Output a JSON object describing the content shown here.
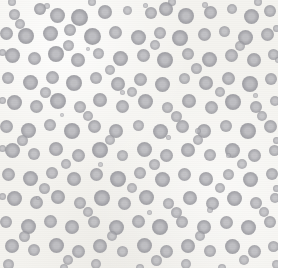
{
  "image": {
    "kind": "micrograph",
    "subject": "blood-smear-erythrocytes",
    "width": 284,
    "height": 274,
    "background_color": "#f4f3ef",
    "border_color": "#ffffff",
    "cell_fill_color": "#9a9aa0",
    "cell_center_color": "#b9b9be",
    "cell_count": 206
  },
  "chart_data": {
    "type": "scatter",
    "title": "",
    "xlabel": "",
    "ylabel": "",
    "xlim": [
      0,
      284
    ],
    "ylim": [
      0,
      274
    ],
    "grid": false,
    "legend": null,
    "points": [
      {
        "x": 14,
        "y": 14,
        "r": 5.5,
        "t": 0.55
      },
      {
        "x": 40,
        "y": 9,
        "r": 6.0,
        "t": 0.7
      },
      {
        "x": 57,
        "y": 15,
        "r": 7.5,
        "t": 0.72
      },
      {
        "x": 79,
        "y": 17,
        "r": 8.5,
        "t": 0.8
      },
      {
        "x": 105,
        "y": 12,
        "r": 7.0,
        "t": 0.7
      },
      {
        "x": 127,
        "y": 10,
        "r": 4.5,
        "t": 0.45
      },
      {
        "x": 151,
        "y": 13,
        "r": 6.0,
        "t": 0.6
      },
      {
        "x": 166,
        "y": 9,
        "r": 7.0,
        "t": 0.74
      },
      {
        "x": 186,
        "y": 16,
        "r": 8.0,
        "t": 0.76
      },
      {
        "x": 210,
        "y": 12,
        "r": 6.5,
        "t": 0.66
      },
      {
        "x": 232,
        "y": 9,
        "r": 5.0,
        "t": 0.52
      },
      {
        "x": 251,
        "y": 16,
        "r": 7.5,
        "t": 0.74
      },
      {
        "x": 270,
        "y": 11,
        "r": 6.0,
        "t": 0.62
      },
      {
        "x": 6,
        "y": 33,
        "r": 6.5,
        "t": 0.66
      },
      {
        "x": 26,
        "y": 36,
        "r": 8.0,
        "t": 0.78
      },
      {
        "x": 50,
        "y": 33,
        "r": 7.5,
        "t": 0.74
      },
      {
        "x": 70,
        "y": 30,
        "r": 6.0,
        "t": 0.62
      },
      {
        "x": 92,
        "y": 36,
        "r": 8.5,
        "t": 0.8
      },
      {
        "x": 115,
        "y": 32,
        "r": 6.5,
        "t": 0.64
      },
      {
        "x": 138,
        "y": 37,
        "r": 7.5,
        "t": 0.72
      },
      {
        "x": 160,
        "y": 33,
        "r": 6.0,
        "t": 0.58
      },
      {
        "x": 180,
        "y": 38,
        "r": 8.0,
        "t": 0.76
      },
      {
        "x": 204,
        "y": 34,
        "r": 6.5,
        "t": 0.66
      },
      {
        "x": 224,
        "y": 31,
        "r": 5.5,
        "t": 0.54
      },
      {
        "x": 245,
        "y": 37,
        "r": 7.5,
        "t": 0.74
      },
      {
        "x": 267,
        "y": 34,
        "r": 6.5,
        "t": 0.64
      },
      {
        "x": 12,
        "y": 55,
        "r": 7.5,
        "t": 0.74
      },
      {
        "x": 34,
        "y": 58,
        "r": 6.5,
        "t": 0.64
      },
      {
        "x": 56,
        "y": 54,
        "r": 8.0,
        "t": 0.78
      },
      {
        "x": 78,
        "y": 60,
        "r": 7.0,
        "t": 0.68
      },
      {
        "x": 98,
        "y": 53,
        "r": 5.5,
        "t": 0.52
      },
      {
        "x": 120,
        "y": 58,
        "r": 7.5,
        "t": 0.72
      },
      {
        "x": 143,
        "y": 55,
        "r": 6.5,
        "t": 0.64
      },
      {
        "x": 165,
        "y": 60,
        "r": 8.0,
        "t": 0.78
      },
      {
        "x": 188,
        "y": 54,
        "r": 6.0,
        "t": 0.58
      },
      {
        "x": 209,
        "y": 59,
        "r": 7.5,
        "t": 0.74
      },
      {
        "x": 231,
        "y": 55,
        "r": 6.5,
        "t": 0.62
      },
      {
        "x": 254,
        "y": 60,
        "r": 7.0,
        "t": 0.7
      },
      {
        "x": 273,
        "y": 54,
        "r": 5.5,
        "t": 0.54
      },
      {
        "x": 8,
        "y": 78,
        "r": 6.0,
        "t": 0.6
      },
      {
        "x": 30,
        "y": 82,
        "r": 7.5,
        "t": 0.74
      },
      {
        "x": 52,
        "y": 77,
        "r": 6.5,
        "t": 0.64
      },
      {
        "x": 74,
        "y": 83,
        "r": 8.0,
        "t": 0.78
      },
      {
        "x": 96,
        "y": 78,
        "r": 6.0,
        "t": 0.58
      },
      {
        "x": 118,
        "y": 84,
        "r": 7.0,
        "t": 0.7
      },
      {
        "x": 140,
        "y": 79,
        "r": 6.5,
        "t": 0.64
      },
      {
        "x": 162,
        "y": 84,
        "r": 7.5,
        "t": 0.74
      },
      {
        "x": 184,
        "y": 78,
        "r": 5.5,
        "t": 0.52
      },
      {
        "x": 206,
        "y": 83,
        "r": 7.0,
        "t": 0.7
      },
      {
        "x": 228,
        "y": 78,
        "r": 6.5,
        "t": 0.64
      },
      {
        "x": 250,
        "y": 84,
        "r": 8.0,
        "t": 0.78
      },
      {
        "x": 271,
        "y": 79,
        "r": 6.0,
        "t": 0.6
      },
      {
        "x": 14,
        "y": 102,
        "r": 7.5,
        "t": 0.74
      },
      {
        "x": 36,
        "y": 106,
        "r": 6.5,
        "t": 0.64
      },
      {
        "x": 58,
        "y": 101,
        "r": 8.0,
        "t": 0.78
      },
      {
        "x": 80,
        "y": 107,
        "r": 6.0,
        "t": 0.58
      },
      {
        "x": 100,
        "y": 100,
        "r": 7.0,
        "t": 0.7
      },
      {
        "x": 122,
        "y": 106,
        "r": 6.5,
        "t": 0.64
      },
      {
        "x": 145,
        "y": 101,
        "r": 7.5,
        "t": 0.74
      },
      {
        "x": 167,
        "y": 107,
        "r": 5.5,
        "t": 0.52
      },
      {
        "x": 189,
        "y": 101,
        "r": 7.0,
        "t": 0.7
      },
      {
        "x": 211,
        "y": 107,
        "r": 6.5,
        "t": 0.64
      },
      {
        "x": 233,
        "y": 102,
        "r": 8.0,
        "t": 0.78
      },
      {
        "x": 256,
        "y": 107,
        "r": 6.0,
        "t": 0.6
      },
      {
        "x": 275,
        "y": 101,
        "r": 5.0,
        "t": 0.48
      },
      {
        "x": 6,
        "y": 126,
        "r": 6.5,
        "t": 0.64
      },
      {
        "x": 28,
        "y": 130,
        "r": 7.5,
        "t": 0.74
      },
      {
        "x": 50,
        "y": 125,
        "r": 6.0,
        "t": 0.58
      },
      {
        "x": 72,
        "y": 131,
        "r": 8.0,
        "t": 0.78
      },
      {
        "x": 94,
        "y": 126,
        "r": 6.5,
        "t": 0.64
      },
      {
        "x": 116,
        "y": 131,
        "r": 7.0,
        "t": 0.7
      },
      {
        "x": 138,
        "y": 125,
        "r": 5.5,
        "t": 0.52
      },
      {
        "x": 160,
        "y": 131,
        "r": 7.5,
        "t": 0.74
      },
      {
        "x": 182,
        "y": 126,
        "r": 6.5,
        "t": 0.64
      },
      {
        "x": 204,
        "y": 131,
        "r": 7.0,
        "t": 0.7
      },
      {
        "x": 226,
        "y": 126,
        "r": 6.0,
        "t": 0.58
      },
      {
        "x": 248,
        "y": 131,
        "r": 8.0,
        "t": 0.78
      },
      {
        "x": 270,
        "y": 126,
        "r": 6.5,
        "t": 0.64
      },
      {
        "x": 12,
        "y": 150,
        "r": 7.5,
        "t": 0.74
      },
      {
        "x": 34,
        "y": 154,
        "r": 6.0,
        "t": 0.58
      },
      {
        "x": 56,
        "y": 149,
        "r": 7.0,
        "t": 0.7
      },
      {
        "x": 78,
        "y": 155,
        "r": 6.5,
        "t": 0.64
      },
      {
        "x": 100,
        "y": 150,
        "r": 8.0,
        "t": 0.78
      },
      {
        "x": 122,
        "y": 155,
        "r": 5.5,
        "t": 0.52
      },
      {
        "x": 144,
        "y": 149,
        "r": 7.5,
        "t": 0.74
      },
      {
        "x": 166,
        "y": 155,
        "r": 6.5,
        "t": 0.64
      },
      {
        "x": 188,
        "y": 150,
        "r": 7.0,
        "t": 0.7
      },
      {
        "x": 210,
        "y": 155,
        "r": 6.0,
        "t": 0.58
      },
      {
        "x": 232,
        "y": 150,
        "r": 7.5,
        "t": 0.74
      },
      {
        "x": 254,
        "y": 155,
        "r": 6.5,
        "t": 0.64
      },
      {
        "x": 274,
        "y": 150,
        "r": 5.5,
        "t": 0.54
      },
      {
        "x": 8,
        "y": 174,
        "r": 6.5,
        "t": 0.64
      },
      {
        "x": 30,
        "y": 178,
        "r": 7.5,
        "t": 0.74
      },
      {
        "x": 52,
        "y": 173,
        "r": 6.0,
        "t": 0.58
      },
      {
        "x": 74,
        "y": 179,
        "r": 7.0,
        "t": 0.7
      },
      {
        "x": 96,
        "y": 174,
        "r": 6.5,
        "t": 0.64
      },
      {
        "x": 118,
        "y": 179,
        "r": 8.0,
        "t": 0.78
      },
      {
        "x": 140,
        "y": 173,
        "r": 6.0,
        "t": 0.58
      },
      {
        "x": 162,
        "y": 179,
        "r": 7.5,
        "t": 0.74
      },
      {
        "x": 184,
        "y": 174,
        "r": 6.5,
        "t": 0.64
      },
      {
        "x": 206,
        "y": 179,
        "r": 7.0,
        "t": 0.7
      },
      {
        "x": 228,
        "y": 174,
        "r": 5.5,
        "t": 0.52
      },
      {
        "x": 250,
        "y": 179,
        "r": 7.5,
        "t": 0.74
      },
      {
        "x": 272,
        "y": 174,
        "r": 6.0,
        "t": 0.6
      },
      {
        "x": 14,
        "y": 198,
        "r": 7.5,
        "t": 0.74
      },
      {
        "x": 36,
        "y": 202,
        "r": 6.5,
        "t": 0.64
      },
      {
        "x": 58,
        "y": 197,
        "r": 7.0,
        "t": 0.7
      },
      {
        "x": 80,
        "y": 203,
        "r": 6.0,
        "t": 0.58
      },
      {
        "x": 102,
        "y": 198,
        "r": 8.0,
        "t": 0.78
      },
      {
        "x": 124,
        "y": 203,
        "r": 6.5,
        "t": 0.64
      },
      {
        "x": 146,
        "y": 197,
        "r": 7.5,
        "t": 0.74
      },
      {
        "x": 168,
        "y": 203,
        "r": 5.5,
        "t": 0.52
      },
      {
        "x": 190,
        "y": 198,
        "r": 7.0,
        "t": 0.7
      },
      {
        "x": 212,
        "y": 203,
        "r": 6.5,
        "t": 0.64
      },
      {
        "x": 234,
        "y": 198,
        "r": 7.5,
        "t": 0.74
      },
      {
        "x": 256,
        "y": 203,
        "r": 6.0,
        "t": 0.58
      },
      {
        "x": 275,
        "y": 198,
        "r": 5.0,
        "t": 0.48
      },
      {
        "x": 6,
        "y": 222,
        "r": 6.0,
        "t": 0.6
      },
      {
        "x": 28,
        "y": 226,
        "r": 7.5,
        "t": 0.74
      },
      {
        "x": 50,
        "y": 221,
        "r": 6.5,
        "t": 0.64
      },
      {
        "x": 72,
        "y": 227,
        "r": 7.0,
        "t": 0.7
      },
      {
        "x": 94,
        "y": 222,
        "r": 6.0,
        "t": 0.58
      },
      {
        "x": 116,
        "y": 227,
        "r": 7.5,
        "t": 0.74
      },
      {
        "x": 138,
        "y": 221,
        "r": 6.5,
        "t": 0.64
      },
      {
        "x": 160,
        "y": 227,
        "r": 8.0,
        "t": 0.78
      },
      {
        "x": 182,
        "y": 222,
        "r": 6.0,
        "t": 0.58
      },
      {
        "x": 204,
        "y": 227,
        "r": 7.0,
        "t": 0.7
      },
      {
        "x": 226,
        "y": 222,
        "r": 6.5,
        "t": 0.64
      },
      {
        "x": 248,
        "y": 227,
        "r": 7.5,
        "t": 0.74
      },
      {
        "x": 270,
        "y": 222,
        "r": 6.0,
        "t": 0.6
      },
      {
        "x": 12,
        "y": 246,
        "r": 7.0,
        "t": 0.7
      },
      {
        "x": 34,
        "y": 250,
        "r": 6.0,
        "t": 0.58
      },
      {
        "x": 56,
        "y": 245,
        "r": 7.5,
        "t": 0.74
      },
      {
        "x": 78,
        "y": 251,
        "r": 6.5,
        "t": 0.64
      },
      {
        "x": 100,
        "y": 246,
        "r": 7.0,
        "t": 0.7
      },
      {
        "x": 122,
        "y": 251,
        "r": 5.5,
        "t": 0.52
      },
      {
        "x": 144,
        "y": 245,
        "r": 7.5,
        "t": 0.74
      },
      {
        "x": 166,
        "y": 251,
        "r": 6.5,
        "t": 0.64
      },
      {
        "x": 188,
        "y": 246,
        "r": 7.0,
        "t": 0.7
      },
      {
        "x": 210,
        "y": 251,
        "r": 6.0,
        "t": 0.58
      },
      {
        "x": 232,
        "y": 246,
        "r": 7.5,
        "t": 0.74
      },
      {
        "x": 254,
        "y": 251,
        "r": 6.5,
        "t": 0.64
      },
      {
        "x": 273,
        "y": 246,
        "r": 5.5,
        "t": 0.54
      },
      {
        "x": 20,
        "y": 24,
        "r": 5.0,
        "t": 0.48
      },
      {
        "x": 68,
        "y": 45,
        "r": 5.5,
        "t": 0.52
      },
      {
        "x": 110,
        "y": 70,
        "r": 5.0,
        "t": 0.46
      },
      {
        "x": 155,
        "y": 45,
        "r": 5.0,
        "t": 0.48
      },
      {
        "x": 196,
        "y": 68,
        "r": 5.5,
        "t": 0.52
      },
      {
        "x": 240,
        "y": 46,
        "r": 5.0,
        "t": 0.46
      },
      {
        "x": 45,
        "y": 92,
        "r": 5.5,
        "t": 0.52
      },
      {
        "x": 88,
        "y": 116,
        "r": 5.0,
        "t": 0.48
      },
      {
        "x": 132,
        "y": 92,
        "r": 5.0,
        "t": 0.46
      },
      {
        "x": 176,
        "y": 116,
        "r": 5.5,
        "t": 0.52
      },
      {
        "x": 220,
        "y": 92,
        "r": 5.0,
        "t": 0.48
      },
      {
        "x": 262,
        "y": 116,
        "r": 5.0,
        "t": 0.46
      },
      {
        "x": 22,
        "y": 140,
        "r": 5.5,
        "t": 0.52
      },
      {
        "x": 66,
        "y": 164,
        "r": 5.0,
        "t": 0.48
      },
      {
        "x": 110,
        "y": 140,
        "r": 5.0,
        "t": 0.46
      },
      {
        "x": 154,
        "y": 164,
        "r": 5.5,
        "t": 0.52
      },
      {
        "x": 198,
        "y": 140,
        "r": 5.0,
        "t": 0.48
      },
      {
        "x": 242,
        "y": 164,
        "r": 5.0,
        "t": 0.46
      },
      {
        "x": 44,
        "y": 188,
        "r": 5.5,
        "t": 0.52
      },
      {
        "x": 88,
        "y": 212,
        "r": 5.0,
        "t": 0.48
      },
      {
        "x": 132,
        "y": 188,
        "r": 5.0,
        "t": 0.46
      },
      {
        "x": 176,
        "y": 212,
        "r": 5.5,
        "t": 0.52
      },
      {
        "x": 220,
        "y": 188,
        "r": 5.0,
        "t": 0.48
      },
      {
        "x": 264,
        "y": 212,
        "r": 5.0,
        "t": 0.46
      },
      {
        "x": 24,
        "y": 236,
        "r": 5.5,
        "t": 0.52
      },
      {
        "x": 68,
        "y": 260,
        "r": 5.0,
        "t": 0.48
      },
      {
        "x": 112,
        "y": 236,
        "r": 5.0,
        "t": 0.46
      },
      {
        "x": 156,
        "y": 260,
        "r": 5.5,
        "t": 0.52
      },
      {
        "x": 200,
        "y": 236,
        "r": 5.0,
        "t": 0.48
      },
      {
        "x": 244,
        "y": 260,
        "r": 5.0,
        "t": 0.46
      },
      {
        "x": 8,
        "y": 264,
        "r": 5.5,
        "t": 0.5
      },
      {
        "x": 96,
        "y": 264,
        "r": 5.0,
        "t": 0.46
      },
      {
        "x": 186,
        "y": 264,
        "r": 5.0,
        "t": 0.44
      },
      {
        "x": 276,
        "y": 264,
        "r": 4.5,
        "t": 0.42
      },
      {
        "x": 47,
        "y": 6,
        "r": 3.0,
        "t": 0.34
      },
      {
        "x": 145,
        "y": 5,
        "r": 2.5,
        "t": 0.3
      },
      {
        "x": 205,
        "y": 5,
        "r": 3.0,
        "t": 0.32
      },
      {
        "x": 88,
        "y": 49,
        "r": 2.0,
        "t": 0.26
      },
      {
        "x": 122,
        "y": 92,
        "r": 2.5,
        "t": 0.28
      },
      {
        "x": 198,
        "y": 131,
        "r": 3.0,
        "t": 0.34
      },
      {
        "x": 168,
        "y": 137,
        "r": 2.5,
        "t": 0.3
      },
      {
        "x": 210,
        "y": 210,
        "r": 3.0,
        "t": 0.32
      },
      {
        "x": 149,
        "y": 212,
        "r": 2.5,
        "t": 0.28
      },
      {
        "x": 228,
        "y": 155,
        "r": 2.5,
        "t": 0.26
      },
      {
        "x": 62,
        "y": 115,
        "r": 2.0,
        "t": 0.24
      },
      {
        "x": 255,
        "y": 95,
        "r": 2.5,
        "t": 0.28
      },
      {
        "x": 38,
        "y": 198,
        "r": 2.0,
        "t": 0.24
      },
      {
        "x": 100,
        "y": 164,
        "r": 2.5,
        "t": 0.26
      },
      {
        "x": 278,
        "y": 60,
        "r": 3.0,
        "t": 0.34
      },
      {
        "x": 2,
        "y": 100,
        "r": 3.5,
        "t": 0.5
      },
      {
        "x": 2,
        "y": 148,
        "r": 3.5,
        "t": 0.48
      },
      {
        "x": 2,
        "y": 196,
        "r": 3.5,
        "t": 0.46
      },
      {
        "x": 2,
        "y": 52,
        "r": 3.5,
        "t": 0.5
      },
      {
        "x": 276,
        "y": 28,
        "r": 3.5,
        "t": 0.48
      },
      {
        "x": 276,
        "y": 140,
        "r": 3.5,
        "t": 0.46
      },
      {
        "x": 276,
        "y": 188,
        "r": 3.5,
        "t": 0.48
      },
      {
        "x": 64,
        "y": 268,
        "r": 4.0,
        "t": 0.42
      },
      {
        "x": 140,
        "y": 268,
        "r": 4.0,
        "t": 0.4
      },
      {
        "x": 222,
        "y": 268,
        "r": 4.0,
        "t": 0.42
      },
      {
        "x": 172,
        "y": 2,
        "r": 4.0,
        "t": 0.44
      },
      {
        "x": 258,
        "y": 2,
        "r": 4.0,
        "t": 0.42
      },
      {
        "x": 92,
        "y": 2,
        "r": 4.0,
        "t": 0.44
      },
      {
        "x": 12,
        "y": 2,
        "r": 4.0,
        "t": 0.42
      }
    ]
  }
}
